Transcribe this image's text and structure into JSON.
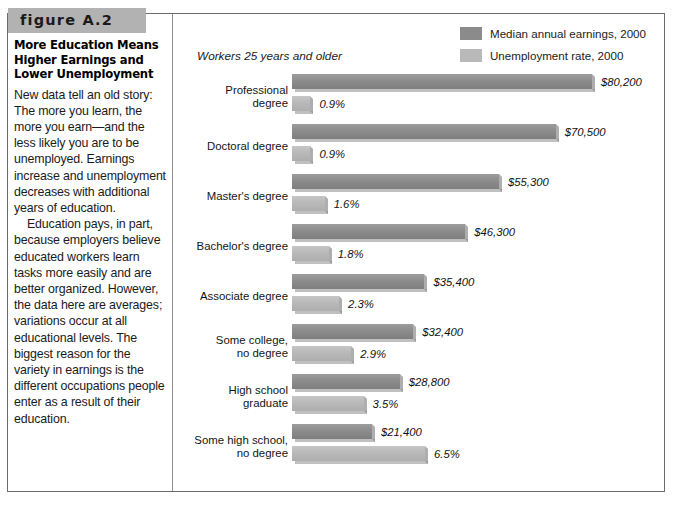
{
  "figure": {
    "number_label": "figure A.2",
    "title": "More Education Means Higher Earnings and Lower Unemployment",
    "paragraphs": [
      "New data tell an old story: The more you learn, the more you earn—and the less likely you are to be unemployed. Earnings increase and unemployment decreases with additional years of education.",
      "Education pays, in part, because employers believe educated workers learn tasks more easily and are better organized. However, the data here are averages; variations occur at all educational levels. The biggest reason for the variety in earnings is the different occupations people enter as a result of their education."
    ]
  },
  "legend": {
    "items": [
      {
        "label": "Median annual earnings, 2000",
        "color": "#8b8b8b",
        "swatch": "dark"
      },
      {
        "label": "Unemployment rate, 2000",
        "color": "#b9b9b9",
        "swatch": "light"
      }
    ]
  },
  "chart_data": {
    "type": "bar",
    "title": "More Education Means Higher Earnings and Lower Unemployment",
    "subtitle": "Workers 25 years and older",
    "orientation": "horizontal",
    "xlabel": "",
    "ylabel": "",
    "grid": false,
    "legend_position": "top-right",
    "categories": [
      "Professional degree",
      "Doctoral degree",
      "Master's degree",
      "Bachelor's degree",
      "Associate degree",
      "Some college, no degree",
      "High school graduate",
      "Some high school, no degree"
    ],
    "series": [
      {
        "name": "Median annual earnings, 2000",
        "units": "USD",
        "color": "#8b8b8b",
        "values": [
          80200,
          70500,
          55300,
          46300,
          35400,
          32400,
          28800,
          21400
        ],
        "labels": [
          "$80,200",
          "$70,500",
          "$55,300",
          "$46,300",
          "$35,400",
          "$32,400",
          "$28,800",
          "$21,400"
        ],
        "axis_max": 80200
      },
      {
        "name": "Unemployment rate, 2000",
        "units": "percent",
        "color": "#b9b9b9",
        "values": [
          0.9,
          0.9,
          1.6,
          1.8,
          2.3,
          2.9,
          3.5,
          6.5
        ],
        "labels": [
          "0.9%",
          "0.9%",
          "1.6%",
          "1.8%",
          "2.3%",
          "2.9%",
          "3.5%",
          "6.5%"
        ],
        "axis_max": 6.5
      }
    ],
    "rows": [
      {
        "category": "Professional degree",
        "lines": [
          "Professional",
          "degree"
        ],
        "earnings": 80200,
        "earnings_label": "$80,200",
        "unemployment": 0.9,
        "unemployment_label": "0.9%"
      },
      {
        "category": "Doctoral degree",
        "lines": [
          "Doctoral degree"
        ],
        "earnings": 70500,
        "earnings_label": "$70,500",
        "unemployment": 0.9,
        "unemployment_label": "0.9%"
      },
      {
        "category": "Master's degree",
        "lines": [
          "Master's degree"
        ],
        "earnings": 55300,
        "earnings_label": "$55,300",
        "unemployment": 1.6,
        "unemployment_label": "1.6%"
      },
      {
        "category": "Bachelor's degree",
        "lines": [
          "Bachelor's degree"
        ],
        "earnings": 46300,
        "earnings_label": "$46,300",
        "unemployment": 1.8,
        "unemployment_label": "1.8%"
      },
      {
        "category": "Associate degree",
        "lines": [
          "Associate degree"
        ],
        "earnings": 35400,
        "earnings_label": "$35,400",
        "unemployment": 2.3,
        "unemployment_label": "2.3%"
      },
      {
        "category": "Some college, no degree",
        "lines": [
          "Some college,",
          "no degree"
        ],
        "earnings": 32400,
        "earnings_label": "$32,400",
        "unemployment": 2.9,
        "unemployment_label": "2.9%"
      },
      {
        "category": "High school graduate",
        "lines": [
          "High school",
          "graduate"
        ],
        "earnings": 28800,
        "earnings_label": "$28,800",
        "unemployment": 3.5,
        "unemployment_label": "3.5%"
      },
      {
        "category": "Some high school, no degree",
        "lines": [
          "Some high school,",
          "no degree"
        ],
        "earnings": 21400,
        "earnings_label": "$21,400",
        "unemployment": 6.5,
        "unemployment_label": "6.5%"
      }
    ]
  },
  "colors": {
    "band": "#b2b2b2",
    "bar_dark": "#8b8b8b",
    "bar_light": "#b9b9b9",
    "frame": "#6b6b6b"
  }
}
